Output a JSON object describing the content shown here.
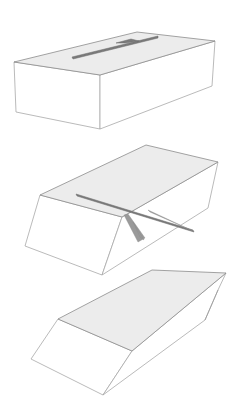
{
  "figure": {
    "colors": {
      "top_face": "#ececec",
      "side_face": "#ffffff",
      "edge": "#9a9a9a",
      "slot": "#7a7a7a"
    },
    "panels": [
      {
        "step": 1,
        "label": "block with slot on top face"
      },
      {
        "step": 2,
        "label": "block cut along slot, blade inserted"
      },
      {
        "step": 3,
        "label": "resulting beveled piece"
      }
    ]
  }
}
